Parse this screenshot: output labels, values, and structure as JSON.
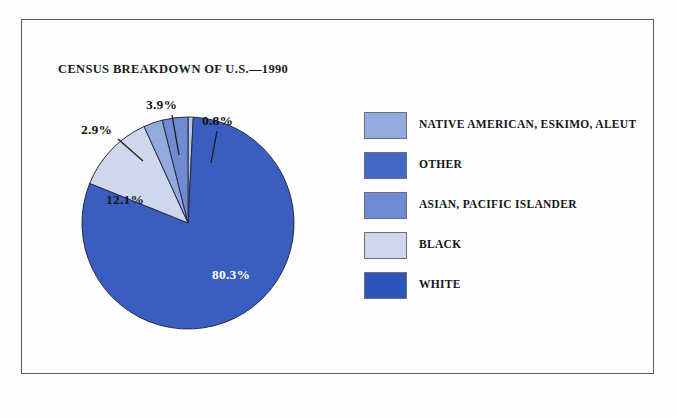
{
  "chart_data": {
    "type": "pie",
    "title": "CENSUS BREAKDOWN OF U.S.—1990",
    "xlabel": "",
    "ylabel": "",
    "legend_position": "right",
    "start_angle_deg": 0,
    "direction": "clockwise",
    "categories": [
      "OTHER",
      "WHITE",
      "BLACK",
      "NATIVE AMERICAN, ESKIMO, ALEUT",
      "ASIAN, PACIFIC ISLANDER"
    ],
    "values": [
      0.8,
      80.3,
      12.1,
      2.9,
      3.9
    ],
    "slices": [
      {
        "label": "OTHER",
        "value": 0.8,
        "value_label": "0.8%",
        "color": "#b9c6e8",
        "label_placement": "outside",
        "label_x": 172,
        "label_y": 38,
        "leader_x1": 187,
        "leader_y1": 56,
        "leader_x2": 181,
        "leader_y2": 88
      },
      {
        "label": "WHITE",
        "value": 80.3,
        "value_label": "80.3%",
        "color": "#3a5ec0",
        "label_placement": "inside-dark",
        "label_x": 182,
        "label_y": 192
      },
      {
        "label": "BLACK",
        "value": 12.1,
        "value_label": "12.1%",
        "color": "#cdd8ee",
        "label_placement": "inside-pale",
        "label_x": 76,
        "label_y": 117
      },
      {
        "label": "NATIVE AMERICAN, ESKIMO, ALEUT",
        "value": 2.9,
        "value_label": "2.9%",
        "color": "#93aadf",
        "label_placement": "outside",
        "label_x": 51,
        "label_y": 47,
        "leader_x1": 88,
        "leader_y1": 64,
        "leader_x2": 113,
        "leader_y2": 86
      },
      {
        "label": "ASIAN, PACIFIC ISLANDER",
        "value": 3.9,
        "value_label": "3.9%",
        "color": "#6e8bd4",
        "label_placement": "outside",
        "label_x": 116,
        "label_y": 22,
        "leader_x1": 142,
        "leader_y1": 40,
        "leader_x2": 149,
        "leader_y2": 80
      }
    ],
    "legend": [
      {
        "label": "NATIVE AMERICAN, ESKIMO, ALEUT",
        "color": "#93aadf"
      },
      {
        "label": "OTHER",
        "color": "#4568c8"
      },
      {
        "label": "ASIAN, PACIFIC ISLANDER",
        "color": "#6e8bd4"
      },
      {
        "label": "BLACK",
        "color": "#cdd8ee"
      },
      {
        "label": "WHITE",
        "color": "#2f55bd"
      }
    ],
    "geometry": {
      "center_x": 158,
      "center_y": 148,
      "radius": 106
    },
    "stroke_color": "#2a2a3c"
  }
}
